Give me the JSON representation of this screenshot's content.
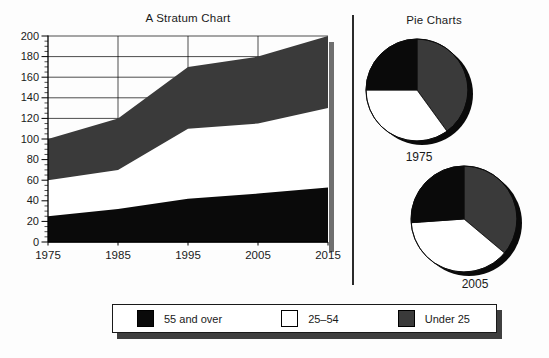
{
  "titles": {
    "stratum": "A Stratum Chart",
    "pies": "Pie Charts"
  },
  "colors": {
    "black": "#0a0a0a",
    "dark_gray": "#3a3a3a",
    "white": "#ffffff",
    "grid": "#000000",
    "plot_shadow": "#6f6f6f",
    "pie_shadow": "#0a0a0a",
    "legend_shadow": "#3f3f3f"
  },
  "chart_data": [
    {
      "id": "stratum",
      "type": "area",
      "stacked": true,
      "title": "A Stratum Chart",
      "x": [
        1975,
        1985,
        1995,
        2005,
        2015
      ],
      "x_tick_labels": [
        "1975",
        "1985",
        "1995",
        "2005",
        "2015"
      ],
      "series": [
        {
          "name": "55 and over",
          "color": "#0a0a0a",
          "values": [
            25,
            32,
            42,
            47,
            53
          ]
        },
        {
          "name": "25–54",
          "color": "#ffffff",
          "values": [
            35,
            38,
            68,
            68,
            77
          ]
        },
        {
          "name": "Under 25",
          "color": "#3a3a3a",
          "values": [
            40,
            50,
            60,
            65,
            70
          ]
        }
      ],
      "cumulative_totals": [
        100,
        120,
        170,
        180,
        200
      ],
      "ylim": [
        0,
        200
      ],
      "y_ticks": [
        0,
        20,
        40,
        60,
        80,
        100,
        120,
        140,
        160,
        180,
        200
      ],
      "y_minor_tick_step": 5,
      "grid": true,
      "legend_position": "bottom"
    },
    {
      "id": "pie-1975",
      "type": "pie",
      "title": "1975",
      "start_angle_deg": 0,
      "direction": "clockwise-from-top",
      "slices": [
        {
          "label": "Under 25",
          "value": 40,
          "color": "#3a3a3a"
        },
        {
          "label": "25–54",
          "value": 35,
          "color": "#ffffff"
        },
        {
          "label": "55 and over",
          "value": 25,
          "color": "#0a0a0a"
        }
      ],
      "total": 100
    },
    {
      "id": "pie-2005",
      "type": "pie",
      "title": "2005",
      "start_angle_deg": 0,
      "direction": "clockwise-from-top",
      "slices": [
        {
          "label": "Under 25",
          "value": 65,
          "color": "#3a3a3a"
        },
        {
          "label": "25–54",
          "value": 68,
          "color": "#ffffff"
        },
        {
          "label": "55 and over",
          "value": 47,
          "color": "#0a0a0a"
        }
      ],
      "total": 180
    }
  ],
  "legend": {
    "items": [
      {
        "label": "55 and over",
        "color": "#0a0a0a"
      },
      {
        "label": "25–54",
        "color": "#ffffff"
      },
      {
        "label": "Under 25",
        "color": "#3a3a3a"
      }
    ]
  }
}
